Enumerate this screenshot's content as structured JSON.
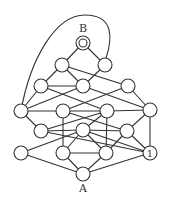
{
  "diagram": {
    "type": "graph",
    "labels": {
      "top": "B",
      "bottom": "A",
      "node_marker": "1"
    },
    "node_radius": 7,
    "nodes": [
      {
        "id": "B",
        "x": 83,
        "y": 43,
        "double": true
      },
      {
        "id": "P1",
        "x": 62,
        "y": 65
      },
      {
        "id": "P2",
        "x": 105,
        "y": 65
      },
      {
        "id": "Q1",
        "x": 41,
        "y": 86
      },
      {
        "id": "Q2",
        "x": 83,
        "y": 86
      },
      {
        "id": "Q3",
        "x": 128,
        "y": 86
      },
      {
        "id": "R1",
        "x": 21,
        "y": 111
      },
      {
        "id": "R2",
        "x": 63,
        "y": 111
      },
      {
        "id": "R3",
        "x": 107,
        "y": 111
      },
      {
        "id": "R4",
        "x": 150,
        "y": 110
      },
      {
        "id": "S1",
        "x": 41,
        "y": 131
      },
      {
        "id": "S2",
        "x": 83,
        "y": 130
      },
      {
        "id": "S3",
        "x": 127,
        "y": 131
      },
      {
        "id": "T1",
        "x": 21,
        "y": 153
      },
      {
        "id": "T2",
        "x": 63,
        "y": 153
      },
      {
        "id": "T3",
        "x": 106,
        "y": 153
      },
      {
        "id": "T4",
        "x": 150,
        "y": 153,
        "text": "1"
      },
      {
        "id": "A",
        "x": 83,
        "y": 174
      }
    ],
    "edges": [
      [
        "B",
        "P1"
      ],
      [
        "B",
        "P2"
      ],
      [
        "P1",
        "Q1"
      ],
      [
        "P1",
        "Q2"
      ],
      [
        "P1",
        "Q3"
      ],
      [
        "P2",
        "Q2"
      ],
      [
        "Q1",
        "Q2"
      ],
      [
        "Q1",
        "R1"
      ],
      [
        "Q1",
        "R3"
      ],
      [
        "Q2",
        "R1"
      ],
      [
        "Q2",
        "R4"
      ],
      [
        "Q3",
        "R2"
      ],
      [
        "Q3",
        "R4"
      ],
      [
        "R1",
        "R2"
      ],
      [
        "R2",
        "R3"
      ],
      [
        "R3",
        "R4"
      ],
      [
        "R1",
        "S1"
      ],
      [
        "R2",
        "S3"
      ],
      [
        "R3",
        "S1"
      ],
      [
        "R3",
        "S2"
      ],
      [
        "R2",
        "T2"
      ],
      [
        "R3",
        "T3"
      ],
      [
        "R4",
        "S3"
      ],
      [
        "R4",
        "T4"
      ],
      [
        "S1",
        "S2"
      ],
      [
        "S2",
        "S3"
      ],
      [
        "S2",
        "T2"
      ],
      [
        "S2",
        "T3"
      ],
      [
        "S2",
        "T4"
      ],
      [
        "S1",
        "T4"
      ],
      [
        "T1",
        "S2"
      ],
      [
        "S3",
        "T3"
      ],
      [
        "S3",
        "T4"
      ],
      [
        "T2",
        "T3"
      ],
      [
        "T1",
        "A"
      ],
      [
        "T2",
        "A"
      ],
      [
        "T3",
        "A"
      ],
      [
        "T4",
        "A"
      ]
    ],
    "outer_curve": "M 21 111 C 30 60, 55 15, 85 15 C 115 15, 112 40, 106 58"
  }
}
